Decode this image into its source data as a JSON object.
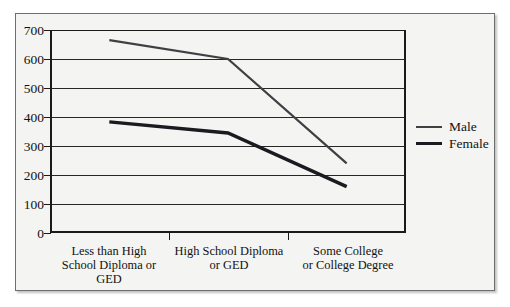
{
  "chart_data": {
    "type": "line",
    "title": "",
    "subtitle": "",
    "xlabel": "",
    "ylabel": "",
    "categories": [
      "Less than High School Diploma or GED",
      "High School Diploma or GED",
      "Some College or College Degree"
    ],
    "category_lines": [
      [
        "Less than High",
        "School Diploma or",
        "GED"
      ],
      [
        "High School Diploma",
        "or GED"
      ],
      [
        "Some College",
        "or College Degree"
      ]
    ],
    "series": [
      {
        "name": "Male",
        "values": [
          665,
          600,
          240
        ],
        "color": "#3f3f44",
        "width": 2.2
      },
      {
        "name": "Female",
        "values": [
          383,
          345,
          160
        ],
        "color": "#1a1a20",
        "width": 3.4
      }
    ],
    "ylim": [
      0,
      700
    ],
    "yticks": [
      0,
      100,
      200,
      300,
      400,
      500,
      600,
      700
    ],
    "ytick_labels": [
      "0",
      "100",
      "200",
      "300",
      "400",
      "500",
      "600",
      "700"
    ],
    "grid": true,
    "grid_axis": "y",
    "legend_position": "right",
    "legend_entries": [
      "Male",
      "Female"
    ]
  },
  "legend": {
    "male_label": "Male",
    "female_label": "Female"
  }
}
